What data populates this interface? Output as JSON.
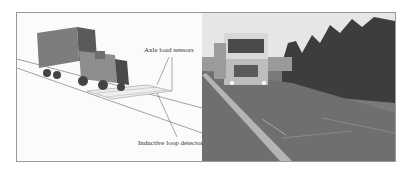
{
  "figure": {
    "left_panel": {
      "type": "schematic",
      "labels": {
        "axle_sensors": "Axle load sensors",
        "loop_detector": "Inductive loop detector"
      }
    },
    "right_panel": {
      "type": "photograph",
      "subject": "truck on road with weigh-in-motion sensors"
    }
  }
}
